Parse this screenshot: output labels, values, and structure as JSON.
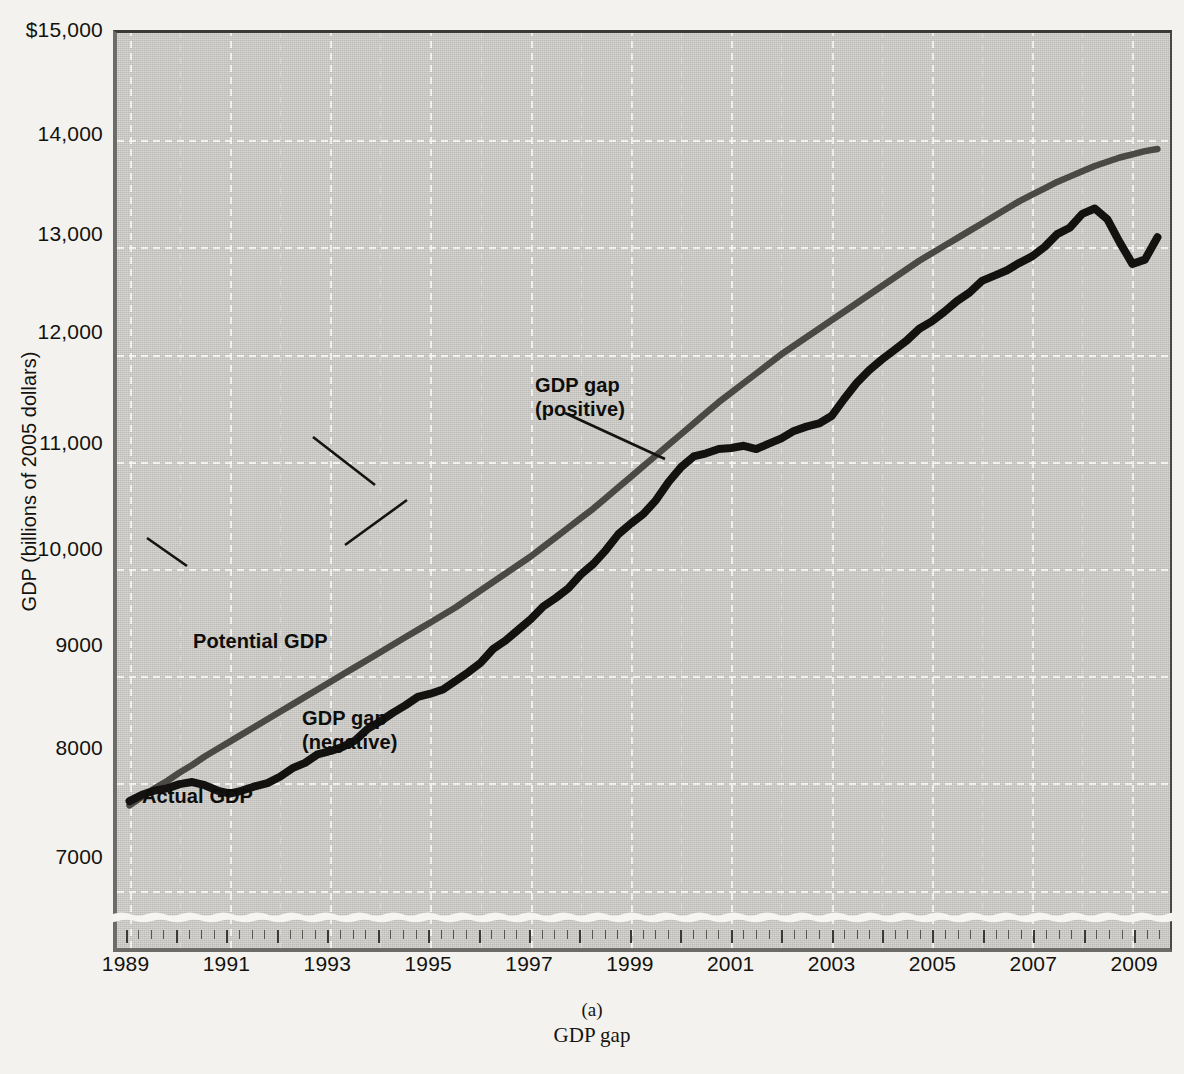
{
  "figure": {
    "caption_label": "(a)",
    "caption_title": "GDP gap"
  },
  "axes": {
    "y_title": "GDP (billions of 2005 dollars)",
    "y_ticks": [
      "$15,000",
      "14,000",
      "13,000",
      "12,000",
      "11,000",
      "10,000",
      "9000",
      "8000",
      "7000"
    ],
    "y_tick_values": [
      15000,
      14000,
      13000,
      12000,
      11000,
      10000,
      9000,
      8000,
      7000
    ],
    "x_ticks": [
      "1989",
      "1991",
      "1993",
      "1995",
      "1997",
      "1999",
      "2001",
      "2003",
      "2005",
      "2007",
      "2009"
    ],
    "x_tick_values": [
      1989,
      1991,
      1993,
      1995,
      1997,
      1999,
      2001,
      2003,
      2005,
      2007,
      2009
    ]
  },
  "annotations": {
    "potential": "Potential GDP",
    "actual": "Actual GDP",
    "gap_positive_line1": "GDP gap",
    "gap_positive_line2": "(positive)",
    "gap_negative_line1": "GDP gap",
    "gap_negative_line2": "(negative)"
  },
  "colors": {
    "plot_background": "#c9c7c3",
    "actual_line": "#15140f",
    "potential_line": "#4b4944",
    "gridline": "#ffffff",
    "positive_gap_fill": "#9e9c97",
    "axis": "#3c3a36"
  },
  "chart_data": {
    "type": "line",
    "title": "GDP gap",
    "xlabel": "",
    "ylabel": "GDP (billions of 2005 dollars)",
    "xlim": [
      1988.75,
      2009.75
    ],
    "ylim": [
      6400,
      15000
    ],
    "grid": true,
    "legend": "inline-annotations",
    "axis_break": "y-axis broken below 7000",
    "x": [
      1989.0,
      1989.25,
      1989.5,
      1989.75,
      1990.0,
      1990.25,
      1990.5,
      1990.75,
      1991.0,
      1991.25,
      1991.5,
      1991.75,
      1992.0,
      1992.25,
      1992.5,
      1992.75,
      1993.0,
      1993.25,
      1993.5,
      1993.75,
      1994.0,
      1994.25,
      1994.5,
      1994.75,
      1995.0,
      1995.25,
      1995.5,
      1995.75,
      1996.0,
      1996.25,
      1996.5,
      1996.75,
      1997.0,
      1997.25,
      1997.5,
      1997.75,
      1998.0,
      1998.25,
      1998.5,
      1998.75,
      1999.0,
      1999.25,
      1999.5,
      1999.75,
      2000.0,
      2000.25,
      2000.5,
      2000.75,
      2001.0,
      2001.25,
      2001.5,
      2001.75,
      2002.0,
      2002.25,
      2002.5,
      2002.75,
      2003.0,
      2003.25,
      2003.5,
      2003.75,
      2004.0,
      2004.25,
      2004.5,
      2004.75,
      2005.0,
      2005.25,
      2005.5,
      2005.75,
      2006.0,
      2006.25,
      2006.5,
      2006.75,
      2007.0,
      2007.25,
      2007.5,
      2007.75,
      2008.0,
      2008.25,
      2008.5,
      2008.75,
      2009.0,
      2009.25,
      2009.5
    ],
    "series": [
      {
        "name": "Actual GDP",
        "values": [
          7780,
          7840,
          7880,
          7900,
          7940,
          7960,
          7930,
          7880,
          7850,
          7880,
          7920,
          7950,
          8010,
          8090,
          8140,
          8220,
          8250,
          8290,
          8350,
          8460,
          8530,
          8610,
          8680,
          8760,
          8790,
          8830,
          8910,
          8990,
          9080,
          9210,
          9290,
          9390,
          9490,
          9610,
          9690,
          9780,
          9910,
          10010,
          10140,
          10290,
          10390,
          10480,
          10610,
          10780,
          10920,
          11020,
          11050,
          11090,
          11100,
          11120,
          11090,
          11140,
          11190,
          11260,
          11300,
          11330,
          11400,
          11560,
          11710,
          11830,
          11930,
          12020,
          12110,
          12220,
          12290,
          12380,
          12480,
          12560,
          12670,
          12720,
          12770,
          12840,
          12900,
          12990,
          13110,
          13170,
          13300,
          13350,
          13250,
          13030,
          12830,
          12870,
          13080
        ]
      },
      {
        "name": "Potential GDP",
        "values": [
          7740,
          7820,
          7900,
          7970,
          8050,
          8120,
          8200,
          8270,
          8340,
          8410,
          8480,
          8550,
          8620,
          8690,
          8760,
          8830,
          8900,
          8970,
          9040,
          9110,
          9180,
          9250,
          9320,
          9390,
          9460,
          9530,
          9600,
          9680,
          9760,
          9840,
          9920,
          10000,
          10080,
          10170,
          10260,
          10350,
          10440,
          10530,
          10630,
          10730,
          10830,
          10930,
          11030,
          11130,
          11230,
          11330,
          11430,
          11530,
          11620,
          11710,
          11800,
          11890,
          11980,
          12060,
          12140,
          12220,
          12300,
          12380,
          12460,
          12540,
          12620,
          12700,
          12780,
          12860,
          12930,
          13000,
          13070,
          13140,
          13210,
          13280,
          13350,
          13420,
          13480,
          13540,
          13600,
          13650,
          13700,
          13750,
          13790,
          13830,
          13860,
          13890,
          13910
        ]
      }
    ],
    "notes": [
      "Actual GDP falls below potential GDP during the 1990-91 and 2001 recessions and sharply during the 2008-09 recession (negative GDP gap).",
      "Actual GDP exceeds potential GDP from roughly 1997 to 2001 (positive GDP gap, shaded)."
    ]
  },
  "page_bleed": [
    "scanned page bleed-through text"
  ]
}
